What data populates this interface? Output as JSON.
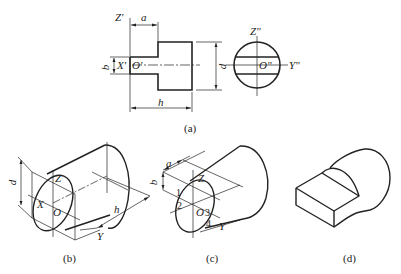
{
  "figure": {
    "panels": [
      {
        "id": "a",
        "caption": "(a)",
        "type": "orthographic-views",
        "front_view_labels": {
          "z_axis": "Z'",
          "x_axis": "X'",
          "origin": "O'"
        },
        "side_view_labels": {
          "z_axis": "Z\"",
          "y_axis": "Y\"",
          "origin": "O\""
        },
        "dimensions": {
          "a": "a",
          "b": "b",
          "d": "d",
          "h": "h"
        }
      },
      {
        "id": "b",
        "caption": "(b)",
        "type": "isometric-cylinder-construction",
        "labels": {
          "z_axis": "Z",
          "x_axis": "X",
          "origin": "O",
          "y_axis": "Y"
        },
        "dimensions": {
          "d": "d",
          "h": "h"
        }
      },
      {
        "id": "c",
        "caption": "(c)",
        "type": "isometric-cut-construction",
        "labels": {
          "z_axis": "Z",
          "origin": "O",
          "y_axis": "Y"
        },
        "dimensions": {
          "a": "a",
          "b": "b"
        },
        "points": [
          "1",
          "2",
          "3",
          "4"
        ]
      },
      {
        "id": "d",
        "caption": "(d)",
        "type": "isometric-result"
      }
    ]
  },
  "colors": {
    "line": "#222222",
    "background": "#ffffff"
  }
}
